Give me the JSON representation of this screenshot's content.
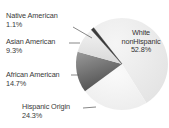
{
  "chart_data": {
    "type": "pie",
    "title": "",
    "categories": [
      "White nonHispanic",
      "Hispanic Origin",
      "African American",
      "Asian American",
      "Native American"
    ],
    "values": [
      52.8,
      24.3,
      14.7,
      9.3,
      1.1
    ],
    "unit": "%",
    "colors": [
      "#ececec",
      "#f4f4f4",
      "#6f6f6f",
      "#e2e2e2",
      "#3a3a3a"
    ],
    "legend": "none (direct labels with leader lines)",
    "labels": [
      {
        "name": "Native American",
        "value": "1.1%"
      },
      {
        "name": "Asian American",
        "value": "9.3%"
      },
      {
        "name": "African American",
        "value": "14.7%"
      },
      {
        "name": "Hispanic Origin",
        "value": "24.3%"
      },
      {
        "name_line1": "White",
        "name_line2": "nonHispanic",
        "value": "52.8%"
      }
    ]
  }
}
